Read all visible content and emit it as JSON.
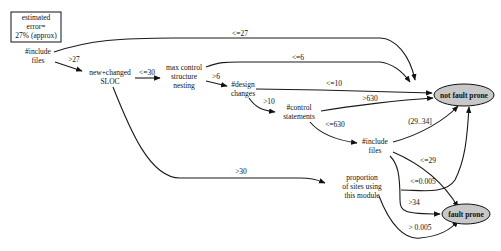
{
  "error_box": {
    "lines": [
      "estimated",
      "error=",
      "27% (approx)"
    ]
  },
  "nodes": {
    "include_files_1": {
      "lines": [
        "#include",
        "files"
      ]
    },
    "new_changed_sloc": {
      "lines": [
        "new+changed",
        "SLOC"
      ]
    },
    "max_control_nesting": {
      "lines": [
        "max control",
        "structure",
        "nesting"
      ]
    },
    "design_changes": {
      "lines": [
        "#design",
        "changes"
      ]
    },
    "control_statements": {
      "lines": [
        "#control",
        "statements"
      ]
    },
    "include_files_2": {
      "lines": [
        "#include",
        "files"
      ]
    },
    "proportion_sites": {
      "lines": [
        "proportion",
        "of sites using",
        "this module"
      ]
    },
    "not_fault_prone": {
      "label": "not fault prone"
    },
    "fault_prone": {
      "label": "fault prone"
    }
  },
  "edges": [
    {
      "from": "include_files_1",
      "to": "not_fault_prone",
      "label": "<=27"
    },
    {
      "from": "include_files_1",
      "to": "new_changed_sloc",
      "label": ">27"
    },
    {
      "from": "new_changed_sloc",
      "to": "max_control_nesting",
      "label": "<=30"
    },
    {
      "from": "new_changed_sloc",
      "to": "proportion_sites",
      "label": ">30"
    },
    {
      "from": "max_control_nesting",
      "to": "not_fault_prone",
      "label": "<=6"
    },
    {
      "from": "max_control_nesting",
      "to": "design_changes",
      "label": ">6"
    },
    {
      "from": "design_changes",
      "to": "not_fault_prone",
      "label": "<=10"
    },
    {
      "from": "design_changes",
      "to": "control_statements",
      "label": ">10"
    },
    {
      "from": "control_statements",
      "to": "not_fault_prone",
      "label": ">630"
    },
    {
      "from": "control_statements",
      "to": "include_files_2",
      "label": "<=630"
    },
    {
      "from": "include_files_2",
      "to": "not_fault_prone",
      "label": "(29..34]"
    },
    {
      "from": "include_files_2",
      "to": "fault_prone",
      "label": "<=29"
    },
    {
      "from": "include_files_2",
      "to": "fault_prone",
      "label": ">34"
    },
    {
      "from": "proportion_sites",
      "to": "not_fault_prone",
      "label": "<=0.005"
    },
    {
      "from": "proportion_sites",
      "to": "fault_prone",
      "label": "> 0.005"
    }
  ]
}
